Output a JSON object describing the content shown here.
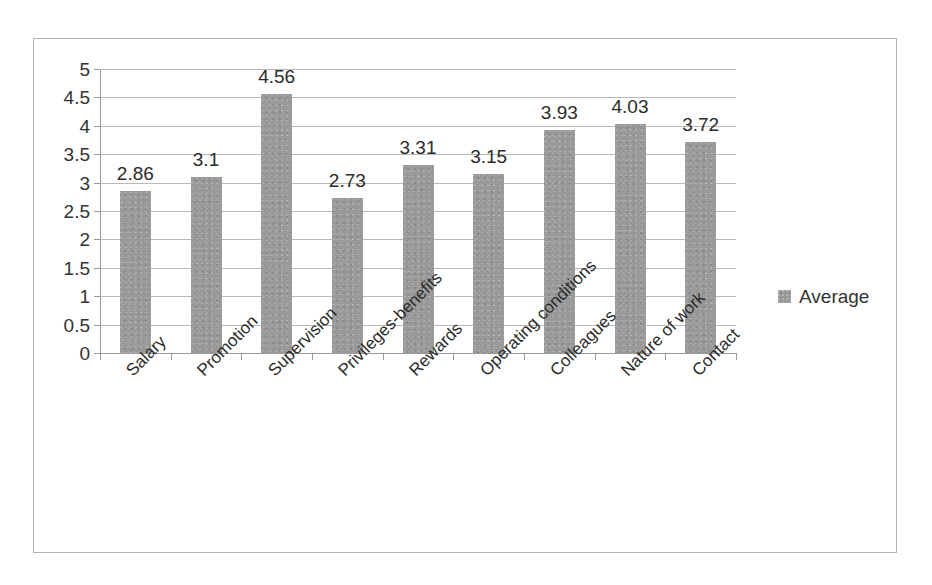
{
  "chart_data": {
    "type": "bar",
    "title": "",
    "subtitle": "",
    "xlabel": "",
    "ylabel": "",
    "categories": [
      "Salary",
      "Promotion",
      "Supervision",
      "Privileges-benefits",
      "Rewards",
      "Operating conditions",
      "Colleagues",
      "Nature of work",
      "Contact"
    ],
    "series": [
      {
        "name": "Average",
        "color": "#999999",
        "values": [
          2.86,
          3.1,
          4.56,
          2.73,
          3.31,
          3.15,
          3.93,
          4.03,
          3.72
        ]
      }
    ],
    "data_labels": [
      "2.86",
      "3.1",
      "4.56",
      "2.73",
      "3.31",
      "3.15",
      "3.93",
      "4.03",
      "3.72"
    ],
    "ylim": [
      0,
      5
    ],
    "ytick_step": 0.5,
    "ytick_labels": [
      "5",
      "4.5",
      "4",
      "3.5",
      "3",
      "2.5",
      "2",
      "1.5",
      "1",
      "0.5",
      "0"
    ],
    "ytick_values": [
      5,
      4.5,
      4,
      3.5,
      3,
      2.5,
      2,
      1.5,
      1,
      0.5,
      0
    ],
    "grid": "horizontal",
    "legend": {
      "position": "right",
      "entries": [
        {
          "label": "Average",
          "marker": "legend-swatch-icon",
          "color": "#999999"
        }
      ]
    },
    "category_label_rotation": -45,
    "colors": {
      "bar": "#999999",
      "gridline": "#b9b9b9",
      "axis": "#9a9a9a",
      "text": "#2b2b2b",
      "frame_border": "#b4b4b4",
      "background": "#ffffff"
    }
  }
}
